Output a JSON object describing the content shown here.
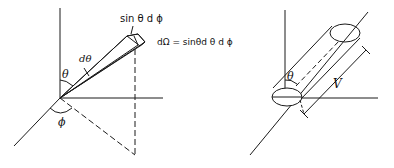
{
  "figures": [
    {
      "name": "solid-angle-cone",
      "labels": {
        "theta": "θ",
        "dtheta": "dθ",
        "phi": "ϕ",
        "arc": "sin θ d ϕ",
        "equation": "dΩ = sinθd θ d ϕ"
      }
    },
    {
      "name": "cylinder-volume",
      "labels": {
        "theta": "θ",
        "length": "V"
      }
    }
  ],
  "colors": {
    "stroke": "#1a1a1a",
    "background": "#ffffff"
  }
}
